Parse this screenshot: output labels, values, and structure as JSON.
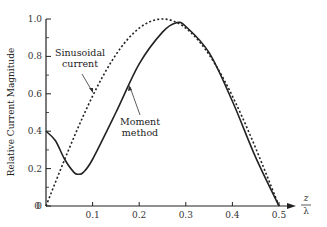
{
  "chart_data": {
    "type": "line",
    "title": "",
    "xlabel": "z/λ",
    "xlabel_num": "z",
    "xlabel_den": "λ",
    "ylabel": "Relative Current Magnitude",
    "xlim": [
      0,
      0.5
    ],
    "ylim": [
      0,
      1.0
    ],
    "grid": false,
    "legend": "none (inline annotations)",
    "x_ticks": [
      "0.1",
      "0.2",
      "0.3",
      "0.4",
      "0.5"
    ],
    "y_ticks": [
      "0",
      "0.2",
      "0.4",
      "0.6",
      "0.8",
      "1.0"
    ],
    "series": [
      {
        "name": "Sinusoidal current",
        "style": "dotted",
        "x": [
          0,
          0.05,
          0.1,
          0.15,
          0.2,
          0.25,
          0.3,
          0.35,
          0.4,
          0.45,
          0.5
        ],
        "y": [
          0,
          0.31,
          0.59,
          0.81,
          0.95,
          1.0,
          0.95,
          0.81,
          0.59,
          0.31,
          0
        ]
      },
      {
        "name": "Moment method",
        "style": "solid",
        "x": [
          0,
          0.02,
          0.04,
          0.06,
          0.07,
          0.08,
          0.1,
          0.15,
          0.2,
          0.25,
          0.28,
          0.3,
          0.35,
          0.4,
          0.45,
          0.5
        ],
        "y": [
          0.4,
          0.35,
          0.25,
          0.18,
          0.17,
          0.18,
          0.25,
          0.5,
          0.76,
          0.93,
          0.98,
          0.96,
          0.82,
          0.56,
          0.26,
          0
        ]
      }
    ],
    "annotations": [
      {
        "text": "Sinusoidal current",
        "lines": [
          "Sinusoidal",
          "current"
        ]
      },
      {
        "text": "Moment method",
        "lines": [
          "Moment",
          "method"
        ]
      }
    ]
  }
}
